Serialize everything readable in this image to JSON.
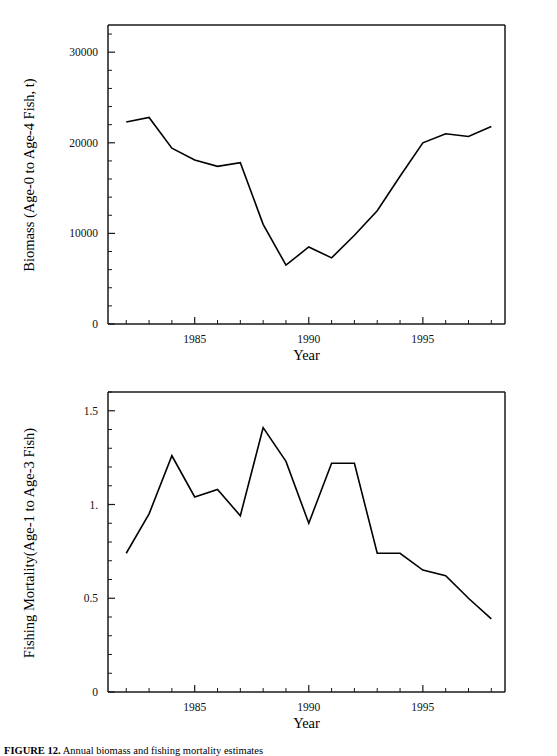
{
  "figure": {
    "caption_prefix": "FIGURE 12.",
    "caption_rest": "Annual biomass and fishing mortality estimates"
  },
  "panels": [
    {
      "id": "biomass",
      "xlabel": "Year",
      "ylabel": "Biomass (Age-0 to Age-4 Fish, t)"
    },
    {
      "id": "mortality",
      "xlabel": "Year",
      "ylabel": "Fishing Mortality(Age-1 to Age-3 Fish)"
    }
  ],
  "chart_data": [
    {
      "type": "line",
      "id": "biomass",
      "title": "",
      "xlabel": "Year",
      "ylabel": "Biomass (Age-0 to Age-4 Fish, t)",
      "x": [
        1982,
        1983,
        1984,
        1985,
        1986,
        1987,
        1988,
        1989,
        1990,
        1991,
        1992,
        1993,
        1994,
        1995,
        1996,
        1997,
        1998
      ],
      "values": [
        22300,
        22800,
        19400,
        18100,
        17400,
        17800,
        11000,
        6500,
        8500,
        7300,
        9800,
        12500,
        16300,
        20000,
        21000,
        20700,
        21800
      ],
      "xlim": [
        1981.2,
        1998.6
      ],
      "ylim": [
        0,
        33000
      ],
      "xticks": [
        1985,
        1990,
        1995
      ],
      "xtick_labels": [
        "1985",
        "1990",
        "1995"
      ],
      "yticks": [
        0,
        10000,
        20000,
        30000
      ],
      "ytick_labels": [
        "0",
        "10000",
        "20000",
        "30000"
      ],
      "grid": false,
      "legend": "none"
    },
    {
      "type": "line",
      "id": "mortality",
      "title": "",
      "xlabel": "Year",
      "ylabel": "Fishing Mortality(Age-1 to Age-3 Fish)",
      "x": [
        1982,
        1983,
        1984,
        1985,
        1986,
        1987,
        1988,
        1989,
        1990,
        1991,
        1992,
        1993,
        1994,
        1995,
        1996,
        1997,
        1998
      ],
      "values": [
        0.74,
        0.95,
        1.26,
        1.04,
        1.08,
        0.94,
        1.41,
        1.23,
        0.9,
        1.22,
        1.22,
        0.74,
        0.74,
        0.65,
        0.62,
        0.5,
        0.39
      ],
      "xlim": [
        1981.2,
        1998.6
      ],
      "ylim": [
        0,
        1.6
      ],
      "xticks": [
        1985,
        1990,
        1995
      ],
      "xtick_labels": [
        "1985",
        "1990",
        "1995"
      ],
      "yticks": [
        0,
        0.5,
        1.0,
        1.5
      ],
      "ytick_labels": [
        "0",
        "0.5",
        "1.",
        "1.5"
      ],
      "grid": false,
      "legend": "none"
    }
  ]
}
